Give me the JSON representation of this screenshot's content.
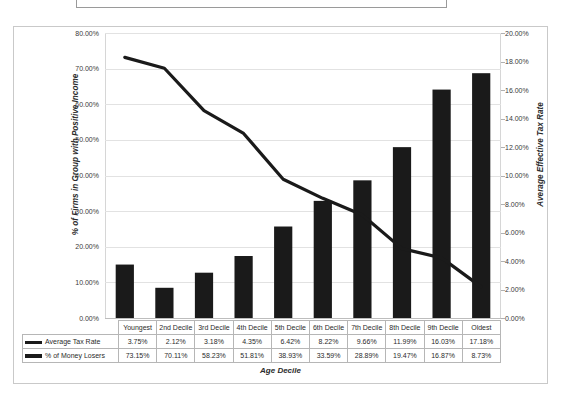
{
  "title_box": {
    "text": ""
  },
  "axes": {
    "ylabel_left": "% of Firms in Group with Positive Income",
    "ylabel_right": "Average Effective Tax Rate",
    "xlabel": "Age Decile",
    "left_ticks": [
      "80.00%",
      "70.00%",
      "60.00%",
      "50.00%",
      "40.00%",
      "30.00%",
      "20.00%",
      "10.00%",
      "0.00%"
    ],
    "right_ticks": [
      "20.00%",
      "18.00%",
      "16.00%",
      "14.00%",
      "12.00%",
      "10.00%",
      "8.00%",
      "6.00%",
      "4.00%",
      "2.00%",
      "0.00%"
    ]
  },
  "legend": {
    "bars": "Average Tax Rate",
    "line": "% of Money Losers"
  },
  "table": {
    "corner": "",
    "header": [
      "Youngest",
      "2nd Decile",
      "3rd Decile",
      "4th Decile",
      "5th Decile",
      "6th Decile",
      "7th Decile",
      "8th Decile",
      "9th Decile",
      "Oldest"
    ],
    "rows": [
      {
        "label": "Average Tax Rate",
        "values": [
          "3.75%",
          "2.12%",
          "3.18%",
          "4.35%",
          "6.42%",
          "8.22%",
          "9.66%",
          "11.99%",
          "16.03%",
          "17.18%"
        ]
      },
      {
        "label": "% of Money Losers",
        "values": [
          "73.15%",
          "70.11%",
          "58.23%",
          "51.81%",
          "38.93%",
          "33.59%",
          "28.89%",
          "19.47%",
          "16.87%",
          "8.73%"
        ]
      }
    ]
  },
  "colors": {
    "series": "#1a1a1a",
    "grid": "#e2e2e2",
    "frame": "#c9c9c9",
    "text": "#2b2b2b"
  },
  "chart_data": {
    "type": "bar",
    "title": "",
    "xlabel": "Age Decile",
    "ylabel": "% of Firms in Group with Positive Income",
    "ylabel_secondary": "Average Effective Tax Rate",
    "categories": [
      "Youngest",
      "2nd Decile",
      "3rd Decile",
      "4th Decile",
      "5th Decile",
      "6th Decile",
      "7th Decile",
      "8th Decile",
      "9th Decile",
      "Oldest"
    ],
    "ylim": [
      0,
      80
    ],
    "ylim_secondary": [
      0,
      20
    ],
    "grid": true,
    "legend_position": "bottom-table",
    "series": [
      {
        "name": "Average Tax Rate",
        "type": "bar",
        "axis": "secondary",
        "unit": "%",
        "values": [
          3.75,
          2.12,
          3.18,
          4.35,
          6.42,
          8.22,
          9.66,
          11.99,
          16.03,
          17.18
        ]
      },
      {
        "name": "% of Money Losers",
        "type": "line",
        "axis": "primary",
        "unit": "%",
        "values": [
          73.15,
          70.11,
          58.23,
          51.81,
          38.93,
          33.59,
          28.89,
          19.47,
          16.87,
          8.73
        ]
      }
    ]
  }
}
